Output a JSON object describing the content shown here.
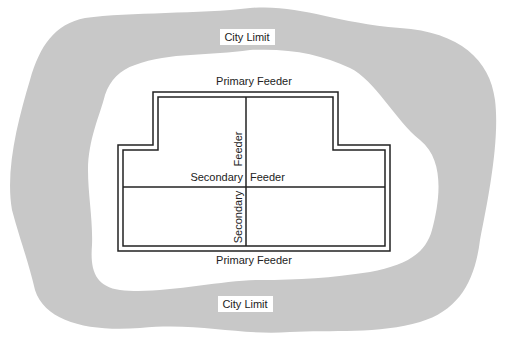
{
  "diagram": {
    "colors": {
      "city_band": "#c8c8c8",
      "background": "#ffffff",
      "line": "#222222"
    },
    "labels": {
      "city_limit_top": "City Limit",
      "city_limit_bottom": "City Limit",
      "primary_feeder_top": "Primary Feeder",
      "primary_feeder_bottom": "Primary Feeder",
      "secondary_feeder_vertical_upper": "Feeder",
      "secondary_feeder_vertical_lower": "Secondary",
      "secondary_feeder_horizontal_left": "Secondary",
      "secondary_feeder_horizontal_right": "Feeder"
    }
  }
}
